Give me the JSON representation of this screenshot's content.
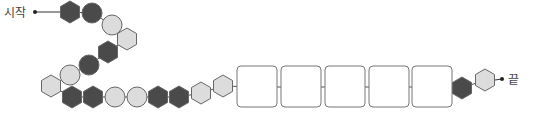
{
  "labels": {
    "start": "시작",
    "end": "끝"
  },
  "colors": {
    "dark": "#4a4a4a",
    "light": "#dcdcdc",
    "stroke": "#666666",
    "box_fill": "#ffffff",
    "box_stroke": "#777777"
  },
  "chain": [
    {
      "shape": "hexagon",
      "tone": "dark"
    },
    {
      "shape": "circle",
      "tone": "dark"
    },
    {
      "shape": "circle",
      "tone": "light"
    },
    {
      "shape": "hexagon",
      "tone": "light"
    },
    {
      "shape": "hexagon",
      "tone": "dark"
    },
    {
      "shape": "circle",
      "tone": "dark"
    },
    {
      "shape": "circle",
      "tone": "light"
    },
    {
      "shape": "hexagon",
      "tone": "light"
    },
    {
      "shape": "hexagon",
      "tone": "dark"
    },
    {
      "shape": "hexagon",
      "tone": "dark"
    },
    {
      "shape": "circle",
      "tone": "light"
    },
    {
      "shape": "circle",
      "tone": "light"
    },
    {
      "shape": "hexagon",
      "tone": "dark"
    },
    {
      "shape": "hexagon",
      "tone": "dark"
    },
    {
      "shape": "hexagon",
      "tone": "light"
    },
    {
      "shape": "hexagon",
      "tone": "light"
    },
    {
      "shape": "box",
      "tone": "empty"
    },
    {
      "shape": "box",
      "tone": "empty"
    },
    {
      "shape": "box",
      "tone": "empty"
    },
    {
      "shape": "box",
      "tone": "empty"
    },
    {
      "shape": "box",
      "tone": "empty"
    },
    {
      "shape": "hexagon",
      "tone": "dark"
    },
    {
      "shape": "hexagon",
      "tone": "light"
    }
  ]
}
